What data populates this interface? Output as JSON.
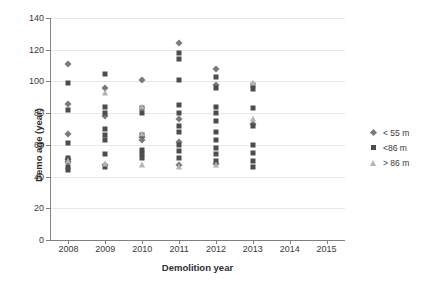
{
  "chart_data": {
    "type": "scatter",
    "title": "",
    "xlabel": "Demolition year",
    "ylabel": "Demo age (year)",
    "xlim": [
      2007.5,
      2015.5
    ],
    "ylim": [
      0,
      140
    ],
    "xticks": [
      "2008",
      "2009",
      "2010",
      "2011",
      "2012",
      "2013",
      "2014",
      "2015"
    ],
    "yticks": [
      "0",
      "20",
      "40",
      "60",
      "80",
      "100",
      "120",
      "140"
    ],
    "grid": "horizontal",
    "legend_position": "right",
    "series": [
      {
        "name": "< 55 m",
        "marker": "diamond",
        "color": "#7a7a7a",
        "points": [
          {
            "x": 2008,
            "y": 111
          },
          {
            "x": 2008,
            "y": 86
          },
          {
            "x": 2008,
            "y": 67
          },
          {
            "x": 2008,
            "y": 51
          },
          {
            "x": 2008,
            "y": 49
          },
          {
            "x": 2009,
            "y": 96
          },
          {
            "x": 2009,
            "y": 78
          },
          {
            "x": 2009,
            "y": 47
          },
          {
            "x": 2010,
            "y": 101
          },
          {
            "x": 2010,
            "y": 65
          },
          {
            "x": 2010,
            "y": 63
          },
          {
            "x": 2011,
            "y": 124
          },
          {
            "x": 2011,
            "y": 76
          },
          {
            "x": 2011,
            "y": 62
          },
          {
            "x": 2011,
            "y": 47
          },
          {
            "x": 2012,
            "y": 108
          },
          {
            "x": 2012,
            "y": 98
          },
          {
            "x": 2012,
            "y": 48
          },
          {
            "x": 2013,
            "y": 73
          }
        ]
      },
      {
        "name": "<86 m",
        "marker": "square",
        "color": "#4d4d4d",
        "points": [
          {
            "x": 2008,
            "y": 99
          },
          {
            "x": 2008,
            "y": 82
          },
          {
            "x": 2008,
            "y": 61
          },
          {
            "x": 2008,
            "y": 52
          },
          {
            "x": 2008,
            "y": 50
          },
          {
            "x": 2008,
            "y": 46
          },
          {
            "x": 2008,
            "y": 44
          },
          {
            "x": 2009,
            "y": 105
          },
          {
            "x": 2009,
            "y": 84
          },
          {
            "x": 2009,
            "y": 80
          },
          {
            "x": 2009,
            "y": 70
          },
          {
            "x": 2009,
            "y": 66
          },
          {
            "x": 2009,
            "y": 63
          },
          {
            "x": 2009,
            "y": 54
          },
          {
            "x": 2009,
            "y": 46
          },
          {
            "x": 2010,
            "y": 83
          },
          {
            "x": 2010,
            "y": 80
          },
          {
            "x": 2010,
            "y": 66
          },
          {
            "x": 2010,
            "y": 57
          },
          {
            "x": 2010,
            "y": 54
          },
          {
            "x": 2010,
            "y": 52
          },
          {
            "x": 2011,
            "y": 118
          },
          {
            "x": 2011,
            "y": 114
          },
          {
            "x": 2011,
            "y": 101
          },
          {
            "x": 2011,
            "y": 85
          },
          {
            "x": 2011,
            "y": 80
          },
          {
            "x": 2011,
            "y": 72
          },
          {
            "x": 2011,
            "y": 68
          },
          {
            "x": 2011,
            "y": 60
          },
          {
            "x": 2011,
            "y": 56
          },
          {
            "x": 2011,
            "y": 52
          },
          {
            "x": 2012,
            "y": 103
          },
          {
            "x": 2012,
            "y": 96
          },
          {
            "x": 2012,
            "y": 84
          },
          {
            "x": 2012,
            "y": 80
          },
          {
            "x": 2012,
            "y": 75
          },
          {
            "x": 2012,
            "y": 68
          },
          {
            "x": 2012,
            "y": 63
          },
          {
            "x": 2012,
            "y": 58
          },
          {
            "x": 2012,
            "y": 54
          },
          {
            "x": 2012,
            "y": 50
          },
          {
            "x": 2013,
            "y": 98
          },
          {
            "x": 2013,
            "y": 95
          },
          {
            "x": 2013,
            "y": 83
          },
          {
            "x": 2013,
            "y": 72
          },
          {
            "x": 2013,
            "y": 60
          },
          {
            "x": 2013,
            "y": 55
          },
          {
            "x": 2013,
            "y": 50
          },
          {
            "x": 2013,
            "y": 46
          }
        ]
      },
      {
        "name": "> 86 m",
        "marker": "triangle",
        "color": "#b4b4b4",
        "points": [
          {
            "x": 2008,
            "y": 50
          },
          {
            "x": 2009,
            "y": 93
          },
          {
            "x": 2009,
            "y": 48
          },
          {
            "x": 2010,
            "y": 84
          },
          {
            "x": 2010,
            "y": 67
          },
          {
            "x": 2010,
            "y": 47
          },
          {
            "x": 2011,
            "y": 46
          },
          {
            "x": 2012,
            "y": 47
          },
          {
            "x": 2013,
            "y": 99
          },
          {
            "x": 2013,
            "y": 76
          }
        ]
      }
    ]
  },
  "legend": {
    "items": [
      {
        "label": "< 55 m",
        "marker": "diamond"
      },
      {
        "label": "<86 m",
        "marker": "square"
      },
      {
        "label": "> 86 m",
        "marker": "triangle"
      }
    ]
  }
}
